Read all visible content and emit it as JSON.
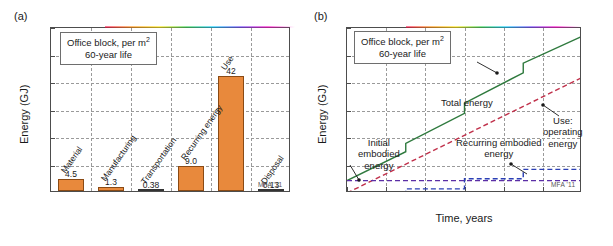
{
  "figure": {
    "watermark": "MFA '11"
  },
  "panel_a": {
    "letter": "(a)",
    "callout_line1": "Office block, per m",
    "callout_sup": "2",
    "callout_line2": "60-year life",
    "chart_data": {
      "type": "bar",
      "title": "",
      "xlabel": "",
      "ylabel": "Energy (GJ)",
      "ylim": [
        0,
        60
      ],
      "yticks": [
        0,
        10,
        20,
        30,
        40,
        50,
        60
      ],
      "grid": true,
      "categories": [
        "Material",
        "Manufacturing",
        "Transportation",
        "Recurring energy",
        "Use",
        "Disposal"
      ],
      "values": [
        4.5,
        1.3,
        0.38,
        9.0,
        42,
        0.13
      ],
      "value_labels": [
        "4.5",
        "1.3",
        "0.38",
        "9.0",
        "42",
        "0.13"
      ],
      "bar_color": "#e8893c"
    }
  },
  "panel_b": {
    "letter": "(b)",
    "callout_line1": "Office block, per m",
    "callout_sup": "2",
    "callout_line2": "60-year life",
    "chart_data": {
      "type": "line",
      "title": "",
      "xlabel": "Time, years",
      "ylabel": "Energy (GJ)",
      "xlim": [
        0,
        60
      ],
      "ylim": [
        0,
        60
      ],
      "xticks": [
        0,
        10,
        20,
        30,
        40,
        50,
        60
      ],
      "yticks": [
        0,
        10,
        20,
        30,
        40,
        50,
        60
      ],
      "grid": true,
      "series": [
        {
          "name": "Total energy",
          "color": "#2f7a3e",
          "style": "solid",
          "points": [
            [
              0,
              4.5
            ],
            [
              15,
              15.0
            ],
            [
              15,
              18.0
            ],
            [
              30,
              29.0
            ],
            [
              30,
              32.7
            ],
            [
              45,
              43.7
            ],
            [
              45,
              47.2
            ],
            [
              60,
              57.0
            ]
          ]
        },
        {
          "name": "Use: operating energy",
          "color": "#c0304a",
          "style": "dashed",
          "points": [
            [
              0,
              0
            ],
            [
              60,
              42
            ]
          ]
        },
        {
          "name": "Initial embodied energy",
          "color": "#5b2fa6",
          "style": "dashed",
          "points": [
            [
              0,
              4.5
            ],
            [
              60,
              4.5
            ]
          ]
        },
        {
          "name": "Recurring embodied energy",
          "color": "#2b3fb5",
          "style": "dashed",
          "points": [
            [
              0,
              0
            ],
            [
              15,
              0
            ],
            [
              15,
              1.5
            ],
            [
              30,
              1.5
            ],
            [
              30,
              5.2
            ],
            [
              45,
              5.2
            ],
            [
              45,
              8.6
            ],
            [
              60,
              8.6
            ]
          ]
        }
      ],
      "annotations": [
        {
          "text": "Total energy",
          "at_x": 37,
          "at_y": 40
        },
        {
          "text": "Use:|operating|energy",
          "at_x": 48,
          "at_y": 32
        },
        {
          "text": "Initial|embodied|energy",
          "at_x": 2,
          "at_y": 4.5
        },
        {
          "text": "Recurring embodied|energy",
          "at_x": 46,
          "at_y": 8.6
        }
      ]
    },
    "labels": {
      "total_energy": "Total energy",
      "use_l1": "Use:",
      "use_l2": "operating",
      "use_l3": "energy",
      "initial_l1": "Initial",
      "initial_l2": "embodied",
      "initial_l3": "energy",
      "recurring_l1": "Recurring embodied",
      "recurring_l2": "energy"
    }
  }
}
